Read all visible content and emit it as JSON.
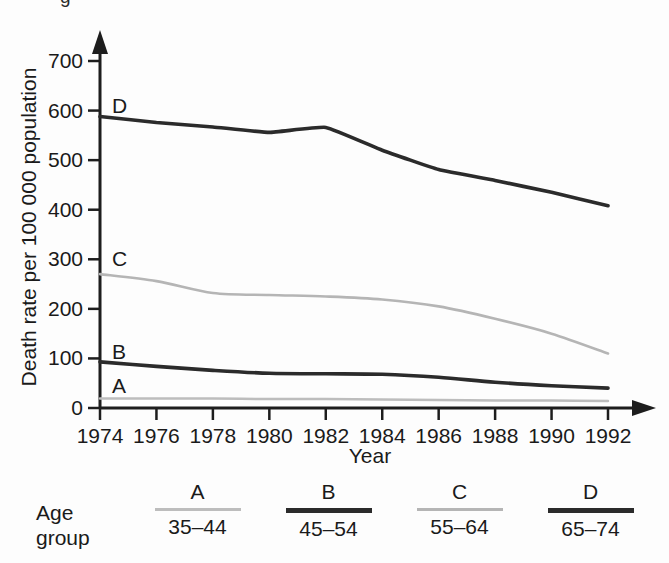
{
  "figure": {
    "cropped_top_text": "g"
  },
  "axes": {
    "ylabel": "Death rate per 100 000 population",
    "xlabel": "Year",
    "yticks": [
      "0",
      "100",
      "200",
      "300",
      "400",
      "500",
      "600",
      "700"
    ],
    "xticks": [
      "1974",
      "1976",
      "1978",
      "1980",
      "1982",
      "1984",
      "1986",
      "1988",
      "1990",
      "1992"
    ]
  },
  "inline_labels": {
    "a": "A",
    "b": "B",
    "c": "C",
    "d": "D"
  },
  "legend": {
    "title_line1": "Age",
    "title_line2": "group",
    "entries": [
      {
        "letter": "A",
        "range": "35–44",
        "color": "#bdbdbd",
        "width": 2.5
      },
      {
        "letter": "B",
        "range": "45–54",
        "color": "#2b2b2b",
        "width": 4.5
      },
      {
        "letter": "C",
        "range": "55–64",
        "color": "#b5b5b5",
        "width": 2.5
      },
      {
        "letter": "D",
        "range": "65–74",
        "color": "#2b2b2b",
        "width": 4.5
      }
    ]
  },
  "chart_data": {
    "type": "line",
    "title": "",
    "xlabel": "Year",
    "ylabel": "Death rate per 100 000 population",
    "xlim": [
      1974,
      1992
    ],
    "ylim": [
      0,
      700
    ],
    "grid": false,
    "legend_position": "below-plot",
    "x": [
      1974,
      1976,
      1978,
      1980,
      1982,
      1984,
      1986,
      1988,
      1990,
      1992
    ],
    "series": [
      {
        "name": "A",
        "label": "35–44",
        "color": "#bdbdbd",
        "values": [
          19,
          19,
          19,
          18,
          18,
          17,
          16,
          15,
          15,
          14
        ]
      },
      {
        "name": "B",
        "label": "45–54",
        "color": "#2b2b2b",
        "values": [
          93,
          84,
          76,
          70,
          69,
          68,
          62,
          52,
          45,
          40
        ]
      },
      {
        "name": "C",
        "label": "55–64",
        "color": "#b5b5b5",
        "values": [
          270,
          256,
          232,
          228,
          225,
          219,
          205,
          180,
          150,
          110
        ]
      },
      {
        "name": "D",
        "label": "65–74",
        "color": "#2b2b2b",
        "values": [
          588,
          576,
          567,
          556,
          566,
          520,
          481,
          459,
          435,
          408
        ]
      }
    ],
    "annotations": [
      {
        "text": "D",
        "x": 1974,
        "y": 610
      },
      {
        "text": "C",
        "x": 1974,
        "y": 300
      },
      {
        "text": "B",
        "x": 1974,
        "y": 112
      },
      {
        "text": "A",
        "x": 1974,
        "y": 45
      }
    ]
  }
}
